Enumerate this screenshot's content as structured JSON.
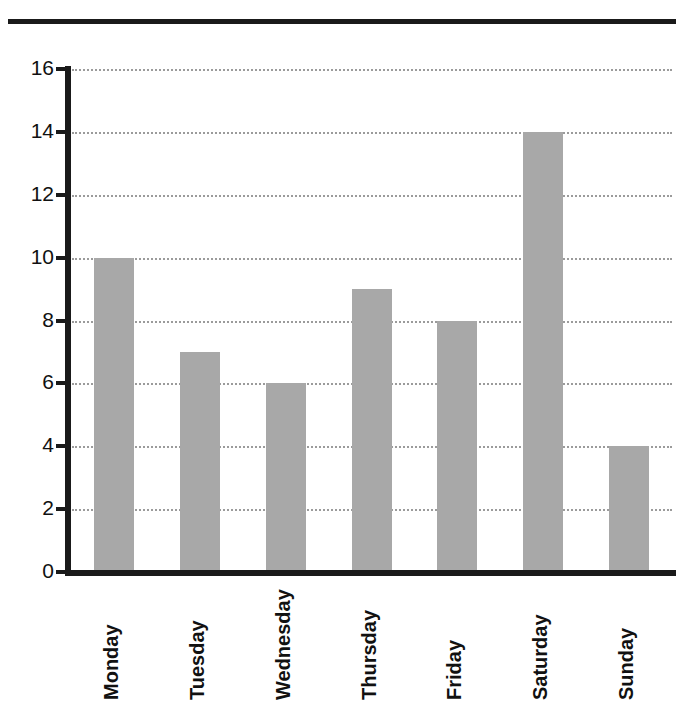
{
  "chart_data": {
    "type": "bar",
    "title": "",
    "title_partially_cropped": true,
    "xlabel": "",
    "ylabel": "",
    "categories": [
      "Monday",
      "Tuesday",
      "Wednesday",
      "Thursday",
      "Friday",
      "Saturday",
      "Sunday"
    ],
    "values": [
      10,
      7,
      6,
      9,
      8,
      14,
      4
    ],
    "ylim": [
      0,
      16
    ],
    "ytick_labels": [
      "0",
      "2",
      "4",
      "6",
      "8",
      "10",
      "12",
      "14",
      "16"
    ],
    "ytick_values": [
      0,
      2,
      4,
      6,
      8,
      10,
      12,
      14,
      16
    ],
    "grid": "horizontal-dotted",
    "legend": "none",
    "bar_color": "#a8a8a8",
    "axis_color": "#1a1a1a",
    "gridline_color": "#9b9b9b",
    "background_color": "#ffffff"
  },
  "figure": {
    "header_rule": "thick-black-horizontal-rule"
  }
}
